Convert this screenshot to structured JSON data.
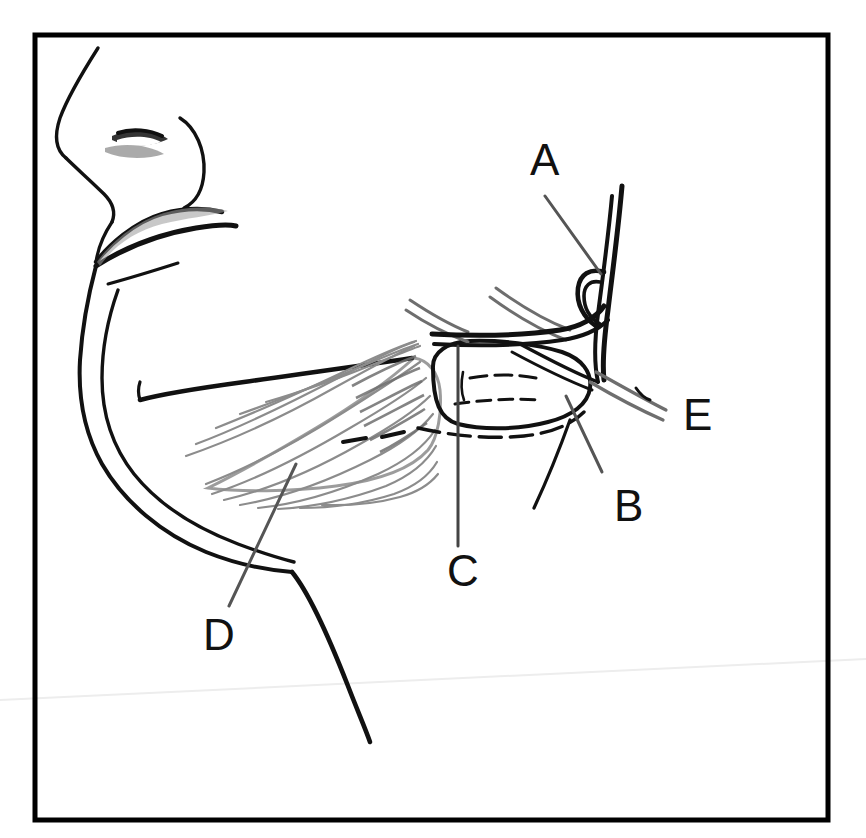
{
  "figure": {
    "kind": "anatomical-line-drawing",
    "background_color": "#ffffff",
    "ink_color": "#111111",
    "hatch_color": "#7a7a7a",
    "frame": {
      "name": "figure-border",
      "x": 35,
      "y": 35,
      "width": 793,
      "height": 785,
      "stroke": "#000000",
      "stroke_width": 5
    },
    "labels": [
      {
        "id": "A",
        "text": "A",
        "x": 530,
        "y": 175,
        "leader_from": [
          545,
          196
        ],
        "leader_to": [
          601,
          274
        ]
      },
      {
        "id": "B",
        "text": "B",
        "x": 614,
        "y": 521,
        "leader_from": [
          566,
          396
        ],
        "leader_to": [
          602,
          472
        ]
      },
      {
        "id": "C",
        "text": "C",
        "x": 447,
        "y": 586,
        "leader_from": [
          458,
          346
        ],
        "leader_to": [
          458,
          546
        ]
      },
      {
        "id": "D",
        "text": "D",
        "x": 203,
        "y": 650,
        "leader_from": [
          296,
          464
        ],
        "leader_to": [
          229,
          606
        ]
      },
      {
        "id": "E",
        "text": "E",
        "x": 683,
        "y": 430,
        "leader_from": null,
        "leader_to": null
      }
    ],
    "artifact": {
      "name": "scanner-streak",
      "from": [
        0,
        700
      ],
      "to": [
        866,
        659
      ],
      "color": "#ededed"
    }
  }
}
